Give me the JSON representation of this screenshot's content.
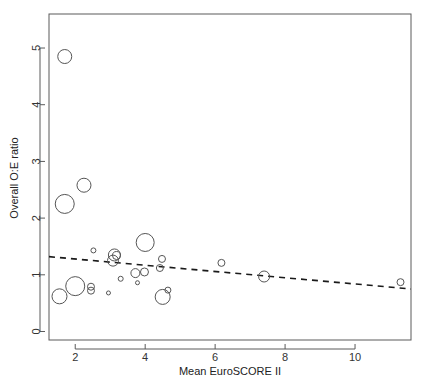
{
  "chart_data": {
    "type": "scatter",
    "title": "",
    "xlabel": "Mean EuroSCORE II",
    "ylabel": "Overall O:E ratio",
    "xlim": [
      1.25,
      11.6
    ],
    "ylim": [
      -0.15,
      5.6
    ],
    "xticks": [
      2,
      4,
      6,
      8,
      10
    ],
    "yticks": [
      0,
      1,
      2,
      3,
      4,
      5
    ],
    "xtick_labels": [
      "2",
      "4",
      "6",
      "8",
      "10"
    ],
    "ytick_labels": [
      "0",
      "1",
      "2",
      "3",
      "4",
      "5"
    ],
    "grid": false,
    "legend": "none",
    "marker": "open-circle",
    "size_encoding": "study weight (bubble radius)",
    "points": [
      {
        "x": 1.7,
        "y": 4.85,
        "r": 7.0
      },
      {
        "x": 1.7,
        "y": 2.25,
        "r": 9.5
      },
      {
        "x": 2.25,
        "y": 2.58,
        "r": 7.0
      },
      {
        "x": 1.55,
        "y": 0.62,
        "r": 7.5
      },
      {
        "x": 2.0,
        "y": 0.8,
        "r": 9.5
      },
      {
        "x": 2.45,
        "y": 0.79,
        "r": 3.5
      },
      {
        "x": 2.45,
        "y": 0.72,
        "r": 3.5
      },
      {
        "x": 2.52,
        "y": 1.43,
        "r": 2.5
      },
      {
        "x": 2.95,
        "y": 0.68,
        "r": 2.0
      },
      {
        "x": 3.08,
        "y": 1.25,
        "r": 5.5
      },
      {
        "x": 3.12,
        "y": 1.35,
        "r": 6.0
      },
      {
        "x": 3.18,
        "y": 1.34,
        "r": 4.0
      },
      {
        "x": 3.3,
        "y": 0.93,
        "r": 2.5
      },
      {
        "x": 3.72,
        "y": 1.03,
        "r": 4.5
      },
      {
        "x": 3.78,
        "y": 0.86,
        "r": 2.0
      },
      {
        "x": 3.98,
        "y": 1.05,
        "r": 4.0
      },
      {
        "x": 4.0,
        "y": 1.57,
        "r": 9.0
      },
      {
        "x": 4.42,
        "y": 1.12,
        "r": 3.5
      },
      {
        "x": 4.48,
        "y": 1.28,
        "r": 3.5
      },
      {
        "x": 4.5,
        "y": 0.61,
        "r": 7.5
      },
      {
        "x": 4.65,
        "y": 0.73,
        "r": 3.0
      },
      {
        "x": 6.18,
        "y": 1.21,
        "r": 3.5
      },
      {
        "x": 7.4,
        "y": 0.97,
        "r": 5.5
      },
      {
        "x": 11.3,
        "y": 0.87,
        "r": 3.5
      }
    ],
    "trend_line": {
      "style": "dashed",
      "x_start": 1.25,
      "y_start": 1.32,
      "x_end": 11.6,
      "y_end": 0.75,
      "slope": -0.055,
      "intercept": 1.389
    }
  }
}
